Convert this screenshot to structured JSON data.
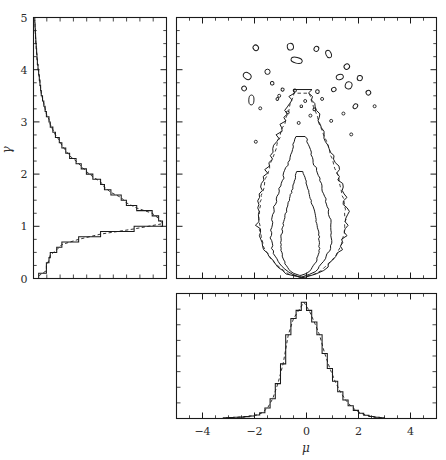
{
  "figure": {
    "type": "corner-plot",
    "background": "#ffffff",
    "line_color": "#1a1a1a",
    "width": 446,
    "height": 460
  },
  "chart_data": {
    "type": "line",
    "title": "",
    "subtitle": "",
    "grid": false,
    "legend": false,
    "panels": [
      {
        "id": "gamma-marginal",
        "role": "left-marginal-histogram",
        "orientation": "horizontal-bars",
        "xlabel": "",
        "ylabel": "γ",
        "ylim": [
          0,
          5
        ],
        "yticks": [
          0,
          1,
          2,
          3,
          4,
          5
        ],
        "ytick_labels": [
          "0",
          "1",
          "2",
          "3",
          "4",
          "5"
        ],
        "xlim": [
          0,
          1
        ],
        "xticks_minor_count": 10,
        "xtick_labels": [],
        "bin_centers": [
          0.05,
          0.15,
          0.25,
          0.35,
          0.45,
          0.55,
          0.65,
          0.75,
          0.85,
          0.95,
          1.05,
          1.15,
          1.25,
          1.35,
          1.45,
          1.55,
          1.65,
          1.75,
          1.85,
          1.95,
          2.05,
          2.15,
          2.25,
          2.35,
          2.45,
          2.55,
          2.65,
          2.75,
          2.85,
          2.95,
          3.05,
          3.15,
          3.25,
          3.35,
          3.45,
          3.55,
          3.65,
          3.75,
          3.85,
          3.95,
          4.05,
          4.15,
          4.25,
          4.35,
          4.45,
          4.55,
          4.65,
          4.75,
          4.85,
          4.95
        ],
        "values": [
          0.04,
          0.1,
          0.1,
          0.12,
          0.13,
          0.18,
          0.22,
          0.35,
          0.52,
          0.78,
          1.0,
          0.97,
          0.92,
          0.8,
          0.72,
          0.68,
          0.6,
          0.55,
          0.52,
          0.46,
          0.41,
          0.37,
          0.33,
          0.28,
          0.25,
          0.22,
          0.2,
          0.17,
          0.15,
          0.13,
          0.12,
          0.1,
          0.09,
          0.08,
          0.07,
          0.06,
          0.055,
          0.05,
          0.045,
          0.04,
          0.035,
          0.03,
          0.027,
          0.024,
          0.021,
          0.018,
          0.016,
          0.014,
          0.012,
          0.01
        ],
        "overlay": {
          "style": "dashed",
          "label": "kde"
        }
      },
      {
        "id": "mu-marginal",
        "role": "bottom-marginal-histogram",
        "orientation": "vertical-bars",
        "xlabel": "μ",
        "ylabel": "",
        "xlim": [
          -5,
          5
        ],
        "xticks": [
          -4,
          -2,
          0,
          2,
          4
        ],
        "xtick_labels": [
          "−4",
          "−2",
          "0",
          "2",
          "4"
        ],
        "ylim": [
          0,
          1
        ],
        "yticks_minor_count": 8,
        "ytick_labels": [],
        "bin_centers": [
          -3.1,
          -2.9,
          -2.7,
          -2.5,
          -2.3,
          -2.1,
          -1.9,
          -1.7,
          -1.5,
          -1.3,
          -1.1,
          -0.9,
          -0.7,
          -0.5,
          -0.3,
          -0.1,
          0.1,
          0.3,
          0.5,
          0.7,
          0.9,
          1.1,
          1.3,
          1.5,
          1.7,
          1.9,
          2.1,
          2.3,
          2.5,
          2.7,
          2.9
        ],
        "values": [
          0.006,
          0.008,
          0.01,
          0.012,
          0.016,
          0.022,
          0.03,
          0.05,
          0.09,
          0.17,
          0.3,
          0.47,
          0.72,
          0.86,
          0.93,
          1.0,
          0.93,
          0.83,
          0.72,
          0.56,
          0.43,
          0.32,
          0.23,
          0.16,
          0.11,
          0.07,
          0.045,
          0.028,
          0.018,
          0.011,
          0.007
        ],
        "overlay": {
          "style": "dashed",
          "label": "kde"
        }
      },
      {
        "id": "joint-contours",
        "role": "joint-contour-panel",
        "xlabel": "μ",
        "ylabel": "γ",
        "xlim": [
          -5,
          5
        ],
        "ylim": [
          0,
          5
        ],
        "xticks": [
          -4,
          -2,
          0,
          2,
          4
        ],
        "yticks": [
          0,
          1,
          2,
          3,
          4,
          5
        ],
        "xtick_labels": [],
        "ytick_labels": [],
        "contour_levels": [
          "inner",
          "middle",
          "outer"
        ],
        "peak": {
          "mu": -0.25,
          "gamma": 0.95
        }
      }
    ]
  },
  "labels": {
    "gamma": "γ",
    "mu": "μ",
    "gamma_ticks": [
      "0",
      "1",
      "2",
      "3",
      "4",
      "5"
    ],
    "mu_ticks": [
      "−4",
      "−2",
      "0",
      "2",
      "4"
    ]
  }
}
